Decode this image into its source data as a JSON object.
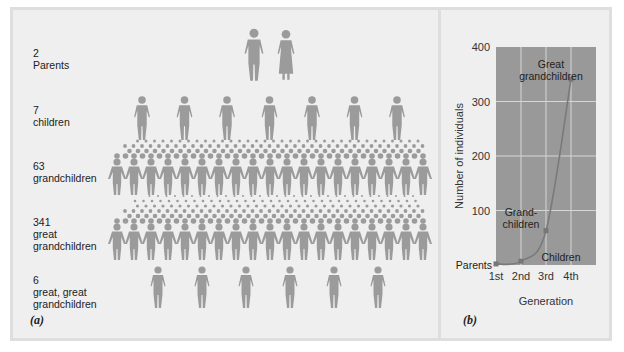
{
  "panel_a": {
    "tag": "(a)",
    "figure_color": "#9b9b9b",
    "rows": [
      {
        "count": "2",
        "label_lines": [
          "Parents"
        ],
        "icons_shown": 2
      },
      {
        "count": "7",
        "label_lines": [
          "children"
        ],
        "icons_shown": 7
      },
      {
        "count": "63",
        "label_lines": [
          "grandchildren"
        ],
        "icons_shown": 63
      },
      {
        "count": "341",
        "label_lines": [
          "great",
          "grandchildren"
        ],
        "icons_shown": 341
      },
      {
        "count": "6",
        "label_lines": [
          "great, great",
          "grandchildren"
        ],
        "icons_shown": 6
      }
    ]
  },
  "panel_b": {
    "tag": "(b)",
    "plot_bg": "#999999",
    "grid_color": "#d8d8d8",
    "line_color": "#7a7a7a"
  },
  "chart_data": [
    {
      "type": "line",
      "title": "",
      "xlabel": "Generation",
      "ylabel": "Number of individuals",
      "categories": [
        "1st",
        "2nd",
        "3rd",
        "4th"
      ],
      "x_tick_labels": [
        "1st",
        "2nd",
        "3rd",
        "4th"
      ],
      "y_tick_labels": [
        "100",
        "200",
        "300",
        "400"
      ],
      "ylim": [
        0,
        400
      ],
      "grid": true,
      "series": [
        {
          "name": "Number of individuals",
          "values": [
            2,
            7,
            63,
            341
          ]
        }
      ],
      "annotations": [
        {
          "text": "Parents",
          "at": "1st"
        },
        {
          "text": "Children",
          "at": "2nd"
        },
        {
          "text": "Grand-children",
          "at": "3rd"
        },
        {
          "text": "Great grandchildren",
          "at": "4th"
        }
      ]
    }
  ]
}
